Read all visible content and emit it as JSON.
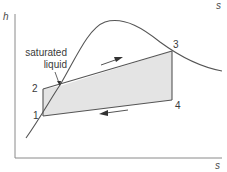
{
  "diagram": {
    "type": "h-s diagram (Rankine cycle)",
    "axes": {
      "y_label": "h",
      "x_label": "s",
      "top_right_label": "s"
    },
    "annotation": {
      "line1": "saturated",
      "line2": "liquid"
    },
    "points": [
      {
        "id": "1",
        "label": "1"
      },
      {
        "id": "2",
        "label": "2"
      },
      {
        "id": "3",
        "label": "3"
      },
      {
        "id": "4",
        "label": "4"
      }
    ],
    "cycle_fill_color": "#e4e4e4",
    "line_color": "#555555",
    "arrows": [
      {
        "name": "heat-addition-arrow",
        "direction": "2 to 3"
      },
      {
        "name": "heat-rejection-arrow",
        "direction": "4 to 1"
      }
    ]
  }
}
